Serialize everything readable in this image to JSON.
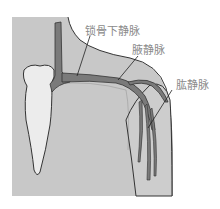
{
  "diagram": {
    "labels": {
      "subclavian_vein": "锁骨下静脉",
      "axillary_vein": "腋静脉",
      "brachial_vein": "肱静脉"
    },
    "colors": {
      "background": "#ffffff",
      "body": "#c8c8c8",
      "skin_light": "#d4d4d4",
      "vein": "#7a7a7a",
      "sternum": "#ececec",
      "outline": "#333333",
      "label_text": "#8a8a8a"
    }
  }
}
